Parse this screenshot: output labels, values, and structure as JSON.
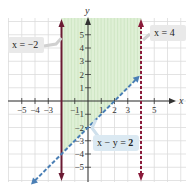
{
  "chart_data": {
    "type": "line",
    "title": "",
    "xlabel": "x",
    "ylabel": "y",
    "xlim": [
      -6,
      6
    ],
    "ylim": [
      -6,
      6
    ],
    "grid": true,
    "x_ticks": [
      -5,
      -4,
      -3,
      -1,
      1,
      2,
      3,
      5
    ],
    "x_tick_labels": [
      "−5",
      "−4",
      "−3",
      "−1",
      "1",
      "2",
      "3",
      "5"
    ],
    "y_ticks": [
      5,
      4,
      3,
      2,
      1,
      -1,
      -2,
      -3,
      -4,
      -5
    ],
    "y_tick_labels": [
      "5",
      "4",
      "3",
      "2",
      "1",
      "−1",
      "−2",
      "−3",
      "−4",
      "−5"
    ],
    "series": [
      {
        "name": "x = −2",
        "kind": "vertical",
        "x": -2,
        "style": "solid",
        "color": "#6b1a33"
      },
      {
        "name": "x = 4",
        "kind": "vertical",
        "x": 4,
        "style": "dashed",
        "color": "#8a1a3a"
      },
      {
        "name": "x − y = 2",
        "kind": "line",
        "slope": 1,
        "intercept": -2,
        "style": "dashed",
        "color": "#4a7fb5",
        "x_range": [
          -4.3,
          3.9
        ]
      }
    ],
    "shaded_region": {
      "description": "−2 ≤ x < 4 and y > x − 2",
      "x_range": [
        -2,
        4
      ],
      "above_line": "x − y = 2",
      "color": "#d9ecd0"
    },
    "annotations": [
      {
        "text": "x = −2",
        "points_to": "x = −2"
      },
      {
        "text": "x = 4",
        "points_to": "x = 4"
      },
      {
        "text": "x − y = 2",
        "points_to": "x − y = 2"
      }
    ]
  },
  "labels": {
    "x_axis": "x",
    "y_axis": "y",
    "callout_left": "x = −2",
    "callout_right": "x = 4",
    "callout_line": "x − y = ",
    "callout_line_bold": "2"
  },
  "colors": {
    "grid": "#dcdcdc",
    "axis": "#333333",
    "shade": "#dff0d6",
    "shade_stripe": "#c9e3bd",
    "solid_line": "#6b1a33",
    "dashed_vertical": "#8a1a3a",
    "dashed_diagonal": "#4a7fb5",
    "callout_bg": "#e9e9e9",
    "callout_line_bg": "#dbe9f2"
  }
}
